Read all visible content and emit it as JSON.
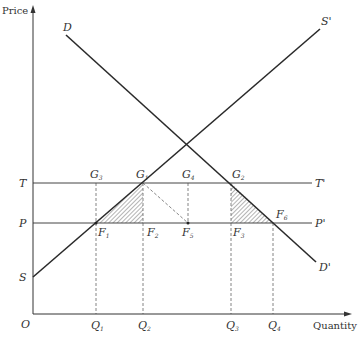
{
  "diagram": {
    "type": "supply-demand-tariff",
    "axes": {
      "y_label": "Price",
      "x_label": "Quantity",
      "origin_label": "O"
    },
    "curves": {
      "demand": {
        "start_label": "D",
        "end_label": "D'"
      },
      "supply": {
        "start_label": "S",
        "end_label": "S'"
      }
    },
    "price_lines": {
      "tariff": {
        "left_label": "T",
        "right_label": "T'"
      },
      "world": {
        "left_label": "P",
        "right_label": "P'"
      }
    },
    "points": {
      "G3": {
        "letter": "G",
        "sub": "3"
      },
      "G1": {
        "letter": "G",
        "sub": "1"
      },
      "G4": {
        "letter": "G",
        "sub": "4"
      },
      "G2": {
        "letter": "G",
        "sub": "2"
      },
      "F1": {
        "letter": "F",
        "sub": "1"
      },
      "F2": {
        "letter": "F",
        "sub": "2"
      },
      "F5": {
        "letter": "F",
        "sub": "5"
      },
      "F3": {
        "letter": "F",
        "sub": "3"
      },
      "F6": {
        "letter": "F",
        "sub": "6"
      }
    },
    "quantities": {
      "Q1": {
        "letter": "Q",
        "sub": "1"
      },
      "Q2": {
        "letter": "Q",
        "sub": "2"
      },
      "Q3": {
        "letter": "Q",
        "sub": "3"
      },
      "Q4": {
        "letter": "Q",
        "sub": "4"
      }
    },
    "shaded_triangles": [
      "F1-G1-F2",
      "G2-F3-F6"
    ],
    "colors": {
      "line": "#2a2a2a",
      "thin": "#555555",
      "text": "#333333"
    }
  }
}
